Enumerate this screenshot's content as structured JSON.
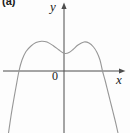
{
  "figure": {
    "label": "(a)"
  },
  "colors": {
    "background": "#fdfdfd",
    "axis": "#4d4d4d",
    "curve": "#979797",
    "text": "#1a1a1a"
  },
  "chart_data": {
    "type": "line",
    "title": "",
    "xlabel": "x",
    "ylabel": "y",
    "origin_label": "0",
    "axis_tick_labels_shown": false,
    "grid": false,
    "legend": false,
    "shape_note": "downward-opening curve with two local maxima and a local minimum just right of the y-axis; crosses x-axis near x=19px and x=102px; y-axis at x=64px, x-axis at y=71px (screen coords)",
    "points_px": [
      [
        8.5,
        133
      ],
      [
        11,
        116
      ],
      [
        13.5,
        101
      ],
      [
        16,
        87
      ],
      [
        19,
        71
      ],
      [
        22,
        60
      ],
      [
        26,
        51.5
      ],
      [
        31,
        46
      ],
      [
        36,
        42.5
      ],
      [
        41.5,
        41.2
      ],
      [
        47,
        42
      ],
      [
        53,
        45.5
      ],
      [
        59,
        50
      ],
      [
        63,
        52.8
      ],
      [
        65.5,
        53.5
      ],
      [
        69,
        52.5
      ],
      [
        73,
        49.5
      ],
      [
        78,
        45
      ],
      [
        84,
        42
      ],
      [
        89,
        43
      ],
      [
        93.5,
        47
      ],
      [
        97,
        52.5
      ],
      [
        100,
        60
      ],
      [
        102.5,
        71
      ],
      [
        105,
        80
      ],
      [
        108,
        92
      ],
      [
        111.5,
        106
      ],
      [
        115,
        120
      ],
      [
        118,
        133
      ]
    ]
  }
}
